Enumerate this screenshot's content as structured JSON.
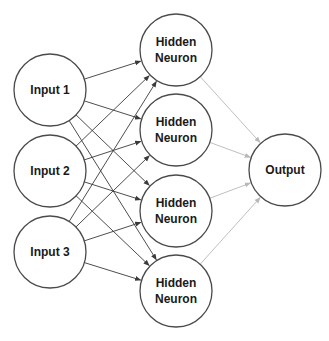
{
  "diagram": {
    "type": "neural-network",
    "colors": {
      "node_stroke": "#4a4a4a",
      "node_fill": "#ffffff",
      "input_edge": "#3a3a3a",
      "output_edge": "#b8b8b8",
      "background": "#ffffff"
    },
    "layers": {
      "input": [
        {
          "id": "in1",
          "label": "Input 1",
          "cx": 50,
          "cy": 90
        },
        {
          "id": "in2",
          "label": "Input 2",
          "cx": 50,
          "cy": 171
        },
        {
          "id": "in3",
          "label": "Input 3",
          "cx": 50,
          "cy": 252
        }
      ],
      "hidden": [
        {
          "id": "h1",
          "line1": "Hidden",
          "line2": "Neuron",
          "cx": 176,
          "cy": 50
        },
        {
          "id": "h2",
          "line1": "Hidden",
          "line2": "Neuron",
          "cx": 176,
          "cy": 130
        },
        {
          "id": "h3",
          "line1": "Hidden",
          "line2": "Neuron",
          "cx": 176,
          "cy": 211
        },
        {
          "id": "h4",
          "line1": "Hidden",
          "line2": "Neuron",
          "cx": 176,
          "cy": 291
        }
      ],
      "output": [
        {
          "id": "out",
          "label": "Output",
          "cx": 285,
          "cy": 170
        }
      ]
    },
    "radius": 36,
    "edges": [
      {
        "from": "in1",
        "to": "h1",
        "style": "dark"
      },
      {
        "from": "in1",
        "to": "h2",
        "style": "dark"
      },
      {
        "from": "in1",
        "to": "h3",
        "style": "dark"
      },
      {
        "from": "in1",
        "to": "h4",
        "style": "dark"
      },
      {
        "from": "in2",
        "to": "h1",
        "style": "dark"
      },
      {
        "from": "in2",
        "to": "h2",
        "style": "dark"
      },
      {
        "from": "in2",
        "to": "h3",
        "style": "dark"
      },
      {
        "from": "in2",
        "to": "h4",
        "style": "dark"
      },
      {
        "from": "in3",
        "to": "h1",
        "style": "dark"
      },
      {
        "from": "in3",
        "to": "h2",
        "style": "dark"
      },
      {
        "from": "in3",
        "to": "h3",
        "style": "dark"
      },
      {
        "from": "in3",
        "to": "h4",
        "style": "dark"
      },
      {
        "from": "h1",
        "to": "out",
        "style": "light"
      },
      {
        "from": "h2",
        "to": "out",
        "style": "light"
      },
      {
        "from": "h3",
        "to": "out",
        "style": "light"
      },
      {
        "from": "h4",
        "to": "out",
        "style": "light"
      }
    ]
  }
}
